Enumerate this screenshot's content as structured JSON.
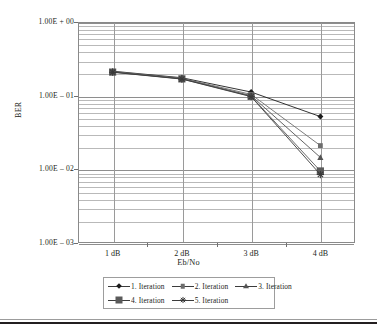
{
  "chart_data": {
    "type": "line",
    "title": "",
    "xlabel": "Eb/No",
    "ylabel": "BER",
    "x": [
      "1 dB",
      "2 dB",
      "3 dB",
      "4 dB"
    ],
    "categories": [
      "1 dB",
      "2 dB",
      "3 dB",
      "4 dB"
    ],
    "yscale": "log",
    "ylim": [
      0.001,
      1
    ],
    "ytick_labels": [
      "1.00E + 00",
      "1.00E – 01",
      "1.00E – 02",
      "1.00E – 03"
    ],
    "ytick_values": [
      1,
      0.1,
      0.01,
      0.001
    ],
    "grid": "log-minor-horizontal-and-category-vertical",
    "legend_position": "bottom",
    "series": [
      {
        "name": "1. Iteration",
        "marker": "diamond",
        "color": "#1c1c1c",
        "values": [
          0.215,
          0.175,
          0.112,
          0.052
        ]
      },
      {
        "name": "2. Iteration",
        "marker": "square-small",
        "color": "#6d6d6d",
        "values": [
          0.212,
          0.172,
          0.104,
          0.021
        ]
      },
      {
        "name": "3. Iteration",
        "marker": "triangle",
        "color": "#545454",
        "values": [
          0.21,
          0.17,
          0.1,
          0.0145
        ]
      },
      {
        "name": "4. Iteration",
        "marker": "square-large",
        "color": "#5a5a5a",
        "values": [
          0.209,
          0.169,
          0.098,
          0.0095
        ]
      },
      {
        "name": "5. Iteration",
        "marker": "star",
        "color": "#3a3a3a",
        "values": [
          0.208,
          0.168,
          0.097,
          0.0085
        ]
      }
    ]
  },
  "axes": {
    "y_label": "BER",
    "x_label": "Eb/No",
    "y_ticks": [
      {
        "label": "1.00E + 00"
      },
      {
        "label": "1.00E – 01"
      },
      {
        "label": "1.00E – 02"
      },
      {
        "label": "1.00E – 03"
      }
    ],
    "x_ticks": [
      {
        "label": "1 dB"
      },
      {
        "label": "2 dB"
      },
      {
        "label": "3 dB"
      },
      {
        "label": "4 dB"
      }
    ]
  },
  "legend": {
    "row1": [
      {
        "label": "1. Iteration",
        "marker": "diamond"
      },
      {
        "label": "2. Iteration",
        "marker": "square-small"
      },
      {
        "label": "3. Iteration",
        "marker": "triangle"
      }
    ],
    "row2": [
      {
        "label": "4. Iteration",
        "marker": "square-large"
      },
      {
        "label": "5. Iteration",
        "marker": "star"
      }
    ]
  }
}
